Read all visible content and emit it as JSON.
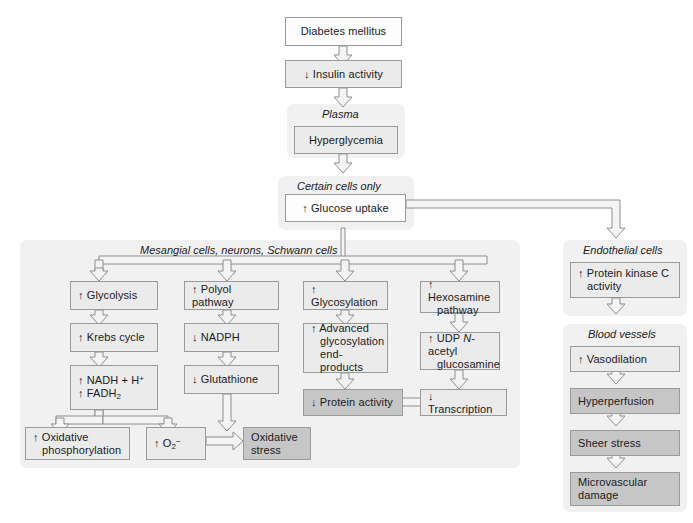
{
  "diagram": {
    "title_flow": "Pathogenesis of diabetic complications",
    "top": {
      "diabetes": "Diabetes mellitus",
      "insulin": "↓ Insulin activity"
    },
    "plasma": {
      "caption": "Plasma",
      "hyperglycemia": "Hyperglycemia"
    },
    "certain_cells": {
      "caption": "Certain cells only",
      "glucose_uptake": "↑ Glucose uptake"
    },
    "mesangial": {
      "caption": "Mesangial cells, neurons, Schwann cells",
      "col1": {
        "b1": "↑ Glycolysis",
        "b2": "↑ Krebs cycle",
        "b3_line1": "↑ NADH + H",
        "b3_sup": "+",
        "b3_line2": "↑ FADH",
        "b3_sub": "2"
      },
      "col2": {
        "b1": "↑ Polyol pathway",
        "b2": "↓ NADPH",
        "b3": "↓ Glutathione"
      },
      "col3": {
        "b1": "↑ Glycosylation",
        "b2_line1": "↑ Advanced",
        "b2_line2": "glycosylation",
        "b2_line3": "end-products",
        "b3": "↓ Protein activity"
      },
      "col4": {
        "b1_line1": "↑ Hexosamine",
        "b1_line2": "pathway",
        "b2_pre": "↑ UDP ",
        "b2_italic": "N",
        "b2_post": "-acetyl",
        "b2_line2": "glucosamine",
        "b3": "↓ Transcription"
      },
      "bottom": {
        "oxphos_line1": "↑ Oxidative",
        "oxphos_line2": "phosphorylation",
        "superoxide_pre": "↑ O",
        "superoxide_sub": "2",
        "superoxide_sup": "−",
        "oxstress_line1": "Oxidative",
        "oxstress_line2": "stress"
      }
    },
    "endothelial": {
      "caption": "Endothelial cells",
      "pkc_line1": "↑ Protein kinase C",
      "pkc_line2": "activity"
    },
    "blood_vessels": {
      "caption": "Blood vessels",
      "b1": "↑ Vasodilation",
      "b2": "Hyperperfusion",
      "b3": "Sheer stress",
      "b4_line1": "Microvascular",
      "b4_line2": "damage"
    },
    "colors": {
      "panel_bg": "#f1f1f1",
      "box_light": "#ebebeb",
      "box_white": "#fdfdfd",
      "box_dark": "#c6c6c6",
      "border": "#9a9a9a",
      "arrow_fill": "#f4f4f4",
      "arrow_stroke": "#8e8e8e",
      "text": "#1a1a1a"
    }
  }
}
